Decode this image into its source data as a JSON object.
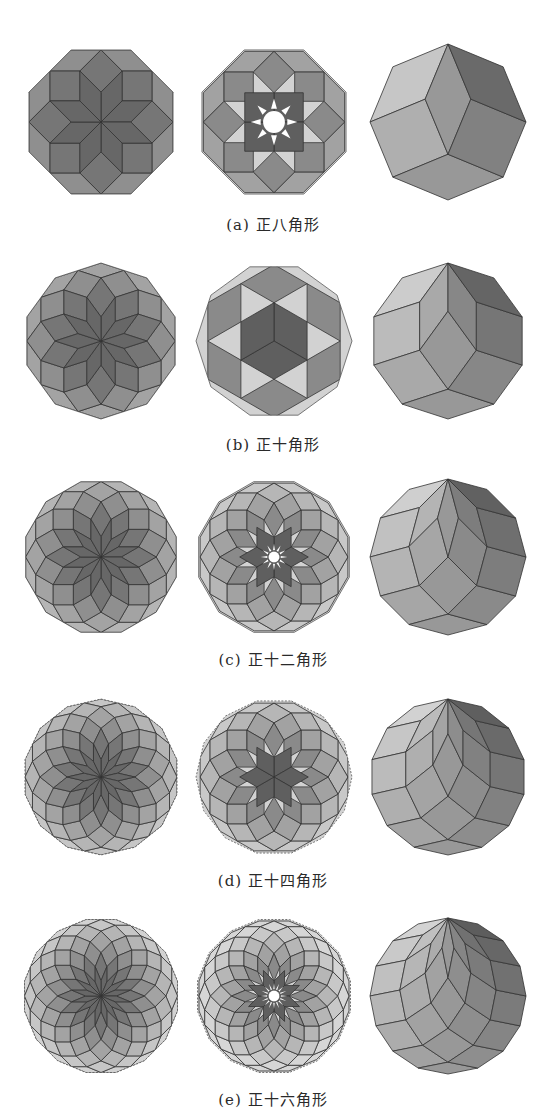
{
  "figure": {
    "columns_cx": [
      101,
      274,
      448
    ],
    "radius": 78,
    "stroke": "#333333",
    "palette": {
      "ring": [
        "#676767",
        "#767676",
        "#8f8f8f",
        "#a3a3a3",
        "#b5b5b5",
        "#c6c6c6",
        "#d2d2d2",
        "#dcdcdc"
      ],
      "light": "#e0e0e0",
      "zono_light": "#dddddd",
      "zono_dark": "#5a5a5a",
      "sun": "#ffffff"
    },
    "rows": [
      {
        "id": "a",
        "n": 4,
        "cy": 122,
        "caption_y": 216,
        "label": "(a)",
        "title": "正八角形",
        "star_arms": 4,
        "sun_spikes": 8
      },
      {
        "id": "b",
        "n": 5,
        "cy": 341,
        "caption_y": 436,
        "label": "(b)",
        "title": "正十角形",
        "star_arms": 3,
        "sun_spikes": 0
      },
      {
        "id": "c",
        "n": 6,
        "cy": 557,
        "caption_y": 651,
        "label": "(c)",
        "title": "正十二角形",
        "star_arms": 6,
        "sun_spikes": 12
      },
      {
        "id": "d",
        "n": 7,
        "cy": 777,
        "caption_y": 872,
        "label": "(d)",
        "title": "正十四角形",
        "star_arms": 6,
        "sun_spikes": 0
      },
      {
        "id": "e",
        "n": 8,
        "cy": 996,
        "caption_y": 1091,
        "label": "(e)",
        "title": "正十六角形",
        "star_arms": 8,
        "sun_spikes": 16
      }
    ]
  }
}
